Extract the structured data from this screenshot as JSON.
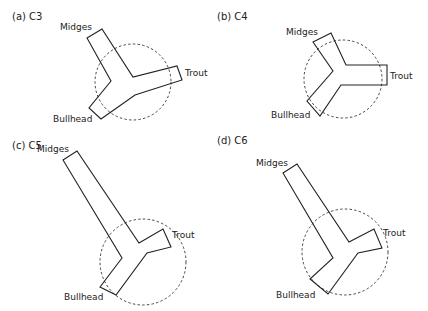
{
  "panels": [
    {
      "id": "a",
      "label": "(a) C3",
      "labels": {
        "midges": "Midges",
        "trout": "Trout",
        "bullhead": "Bullhead"
      },
      "circle": {
        "cx": 133,
        "cy": 82,
        "r": 38
      },
      "polygon": "87,38 102,29 133,77 177,66 182,80 135,95 101,119 89,108 111,81"
    },
    {
      "id": "b",
      "label": "(b) C4",
      "labels": {
        "midges": "Midges",
        "trout": "Trout",
        "bullhead": "Bullhead"
      },
      "circle": {
        "cx": 343,
        "cy": 79,
        "r": 39
      },
      "polygon": "313,42 331,33 346,65 387,65 387,85 341,85 320,116 307,101 333,71"
    },
    {
      "id": "c",
      "label": "(c) C5",
      "labels": {
        "midges": "Midges",
        "trout": "Trout",
        "bullhead": "Bullhead"
      },
      "circle": {
        "cx": 143,
        "cy": 262,
        "r": 43
      },
      "polygon": "63,160 77,151 139,243 163,229 171,247 147,253 116,295 100,287 122,258"
    },
    {
      "id": "d",
      "label": "(d) C6",
      "labels": {
        "midges": "Midges",
        "trout": "Trout",
        "bullhead": "Bullhead"
      },
      "circle": {
        "cx": 345,
        "cy": 252,
        "r": 43
      },
      "polygon": "283,173 297,164 349,242 374,229 382,248 358,253 328,294 310,279 333,258"
    }
  ]
}
